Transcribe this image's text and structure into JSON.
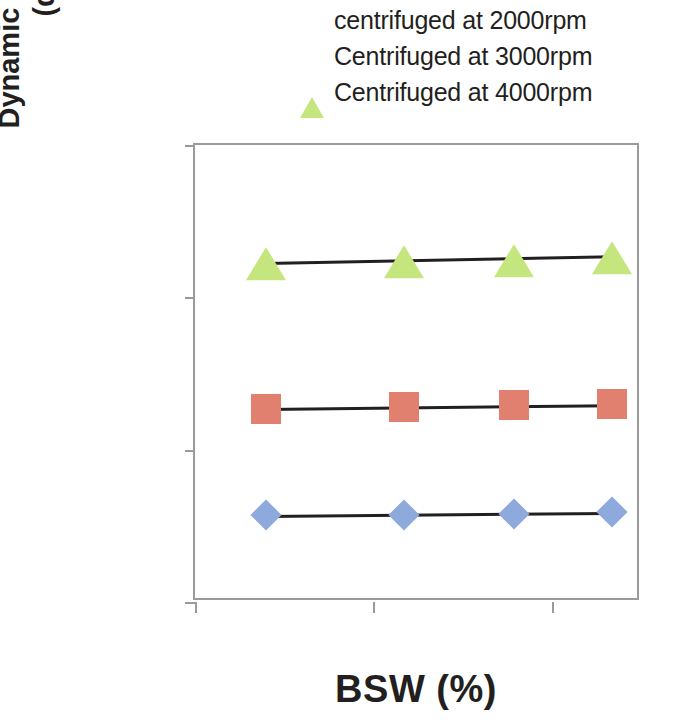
{
  "chart_data": {
    "type": "scatter",
    "title": "",
    "xlabel": "BSW (%)",
    "ylabel_line1": "Dynamic interfacial tension",
    "ylabel_line2": "(dynes/cm)",
    "xlim": [
      5,
      30
    ],
    "ylim": [
      0,
      3
    ],
    "xticks": [
      5,
      15,
      25
    ],
    "yticks": [
      0,
      1,
      2,
      3
    ],
    "grid": false,
    "legend_position": "top-right",
    "series": [
      {
        "name": "centrifuged at 2000rpm",
        "marker": "diamond",
        "color": "#8EA9DB",
        "x": [
          9.0,
          16.7,
          22.9,
          28.4
        ],
        "values": [
          0.57,
          0.57,
          0.58,
          0.59
        ],
        "trendline": [
          0.57,
          0.59
        ]
      },
      {
        "name": "Centrifuged at 3000rpm",
        "marker": "square",
        "color": "#E28070",
        "x": [
          9.0,
          16.7,
          22.9,
          28.4
        ],
        "values": [
          1.27,
          1.28,
          1.29,
          1.3
        ],
        "trendline": [
          1.275,
          1.3
        ]
      },
      {
        "name": "Centrifuged at 4000rpm",
        "marker": "triangle",
        "color": "#C5E57E",
        "x": [
          9.0,
          16.7,
          22.9,
          28.4
        ],
        "values": [
          2.24,
          2.25,
          2.26,
          2.28
        ],
        "trendline": [
          2.235,
          2.28
        ]
      }
    ]
  },
  "legend": {
    "items": [
      {
        "label": "centrifuged at 2000rpm",
        "marker": "diamond"
      },
      {
        "label": "Centrifuged at 3000rpm",
        "marker": "square"
      },
      {
        "label": "Centrifuged at 4000rpm",
        "marker": "triangle"
      }
    ]
  },
  "axes": {
    "y_tick_labels": [
      "3",
      "2",
      "1",
      "0"
    ],
    "x_tick_labels": [
      "5",
      "15",
      "25"
    ],
    "y_title_line1": "Dynamic interfacial tension",
    "y_title_line2": "(dynes/cm)",
    "x_title": "BSW (%)"
  }
}
